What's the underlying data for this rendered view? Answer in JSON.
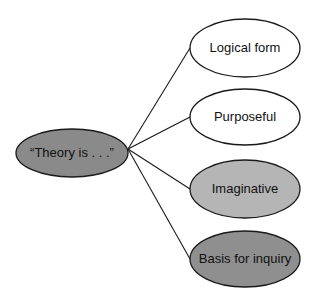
{
  "diagram": {
    "type": "mind-map",
    "center": {
      "label": "“Theory is . . .”",
      "fill": "#8a8a8a",
      "cx": 72,
      "cy": 153,
      "rx": 56,
      "ry": 24
    },
    "hub": {
      "x": 128,
      "y": 149
    },
    "branches": [
      {
        "label": "Logical form",
        "fill": "#ffffff",
        "cx": 245,
        "cy": 48,
        "rx": 55,
        "ry": 29
      },
      {
        "label": "Purposeful",
        "fill": "#ffffff",
        "cx": 245,
        "cy": 117,
        "rx": 55,
        "ry": 28
      },
      {
        "label": "Imaginative",
        "fill": "#b5b5b5",
        "cx": 245,
        "cy": 189,
        "rx": 55,
        "ry": 29
      },
      {
        "label": "Basis for inquiry",
        "fill": "#8f8f8f",
        "cx": 245,
        "cy": 259,
        "rx": 55,
        "ry": 28
      }
    ],
    "stroke": "#1a1a1a"
  }
}
